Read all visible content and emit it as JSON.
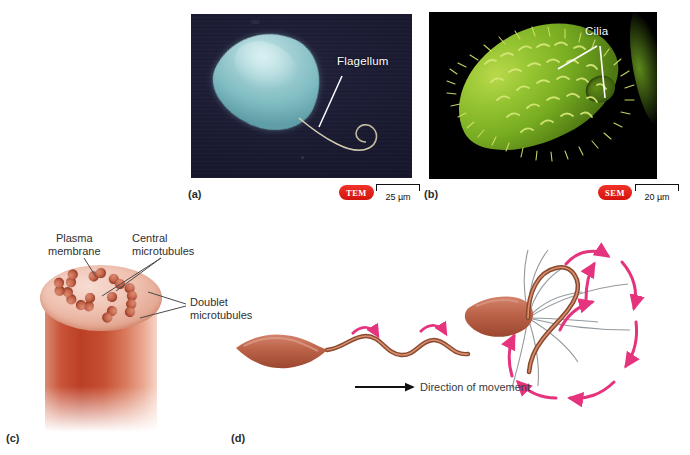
{
  "figure": {
    "background": "#ffffff",
    "accent_badge_color": "#e01b0c",
    "arrow_pink": "#e6337d",
    "trace_gray": "#8a9096"
  },
  "panels": [
    {
      "id": "a",
      "letter": "(a)",
      "kind": "micrograph",
      "technique_badge": "TEM",
      "scale_value": "25 µm",
      "label": "Flagellum",
      "subject": "flagellated-cell",
      "cell_color": "#8fc8cc",
      "background_color": "#191930"
    },
    {
      "id": "b",
      "letter": "(b)",
      "kind": "micrograph",
      "technique_badge": "SEM",
      "scale_value": "20 µm",
      "label": "Cilia",
      "subject": "ciliated-cell",
      "cell_color": "#8fbe2c",
      "background_color": "#000000"
    },
    {
      "id": "c",
      "letter": "(c)",
      "kind": "diagram",
      "subject": "axoneme-cross-section",
      "labels": [
        {
          "name": "plasma-membrane",
          "line1": "Plasma",
          "line2": "membrane"
        },
        {
          "name": "central-microtubules",
          "line1": "Central",
          "line2": "microtubules"
        },
        {
          "name": "doublet-microtubules",
          "line1": "Doublet",
          "line2": "microtubules"
        }
      ],
      "doublet_count": 9,
      "central_count": 2
    },
    {
      "id": "d",
      "letter": "(d)",
      "kind": "diagram",
      "subject": "flagellar-and-ciliary-movement",
      "direction_label": "Direction of movement",
      "left_subject": "flagellum-wave-propagation",
      "right_subject": "cilium-power-and-recovery-stroke"
    }
  ],
  "microtubule_ring": {
    "doublets": [
      {
        "cx": 34,
        "cy": 26
      },
      {
        "cx": 56,
        "cy": 14
      },
      {
        "cx": 82,
        "cy": 12
      },
      {
        "cx": 102,
        "cy": 22
      },
      {
        "cx": 106,
        "cy": 40
      },
      {
        "cx": 88,
        "cy": 50
      },
      {
        "cx": 62,
        "cy": 52
      },
      {
        "cx": 38,
        "cy": 46
      },
      {
        "cx": 24,
        "cy": 36
      }
    ],
    "central": [
      {
        "cx": 50,
        "cy": 33
      },
      {
        "cx": 72,
        "cy": 32
      }
    ]
  }
}
